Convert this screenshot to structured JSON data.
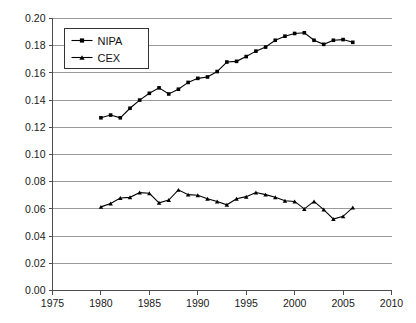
{
  "chart_data": {
    "type": "line",
    "title": "",
    "subtitle": "",
    "xlabel": "",
    "ylabel": "",
    "xlim": [
      1975,
      2010
    ],
    "ylim": [
      0.0,
      0.2
    ],
    "xticks": [
      1975,
      1980,
      1985,
      1990,
      1995,
      2000,
      2005,
      2010
    ],
    "xtick_labels": [
      "1975",
      "1980",
      "1985",
      "1990",
      "1995",
      "2000",
      "2005",
      "2010"
    ],
    "yticks": [
      0.0,
      0.02,
      0.04,
      0.06,
      0.08,
      0.1,
      0.12,
      0.14,
      0.16,
      0.18,
      0.2
    ],
    "ytick_labels": [
      "0.00",
      "0.02",
      "0.04",
      "0.06",
      "0.08",
      "0.10",
      "0.12",
      "0.14",
      "0.16",
      "0.18",
      "0.20"
    ],
    "grid": "horizontal",
    "legend_position": "top-left",
    "x": [
      1980,
      1981,
      1982,
      1983,
      1984,
      1985,
      1986,
      1987,
      1988,
      1989,
      1990,
      1991,
      1992,
      1993,
      1994,
      1995,
      1996,
      1997,
      1998,
      1999,
      2000,
      2001,
      2002,
      2003,
      2004,
      2005,
      2006
    ],
    "series": [
      {
        "name": "NIPA",
        "marker": "square",
        "color": "#000000",
        "values": [
          0.127,
          0.129,
          0.127,
          0.134,
          0.14,
          0.145,
          0.149,
          0.1445,
          0.148,
          0.153,
          0.156,
          0.157,
          0.161,
          0.168,
          0.1685,
          0.172,
          0.176,
          0.179,
          0.184,
          0.187,
          0.189,
          0.1895,
          0.184,
          0.181,
          0.184,
          0.1845,
          0.1825
        ]
      },
      {
        "name": "CEX",
        "marker": "triangle",
        "color": "#000000",
        "values": [
          0.0615,
          0.064,
          0.068,
          0.0685,
          0.072,
          0.0715,
          0.0645,
          0.0665,
          0.074,
          0.0705,
          0.07,
          0.0675,
          0.0655,
          0.063,
          0.0675,
          0.069,
          0.072,
          0.0705,
          0.0685,
          0.066,
          0.0655,
          0.06,
          0.0655,
          0.0595,
          0.0525,
          0.0545,
          0.061
        ]
      }
    ]
  },
  "legend": {
    "items": [
      {
        "label": "NIPA",
        "marker": "square"
      },
      {
        "label": "CEX",
        "marker": "triangle"
      }
    ]
  }
}
